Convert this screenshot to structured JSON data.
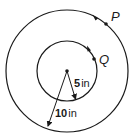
{
  "diagram": {
    "type": "concentric-circles",
    "center": {
      "x": 67,
      "y": 71
    },
    "outer_circle": {
      "radius": 61,
      "radius_label": "10 in",
      "label_num": "10",
      "label_unit": "in"
    },
    "inner_circle": {
      "radius": 30,
      "radius_label": "5 in",
      "label_num": "5",
      "label_unit": "in"
    },
    "points": [
      {
        "name": "P",
        "on": "outer_circle",
        "x": 106,
        "y": 24
      },
      {
        "name": "Q",
        "on": "inner_circle",
        "x": 94,
        "y": 59
      }
    ],
    "rotation_direction": "counterclockwise",
    "colors": {
      "stroke": "#1a1a1a",
      "background": "#ffffff"
    }
  }
}
